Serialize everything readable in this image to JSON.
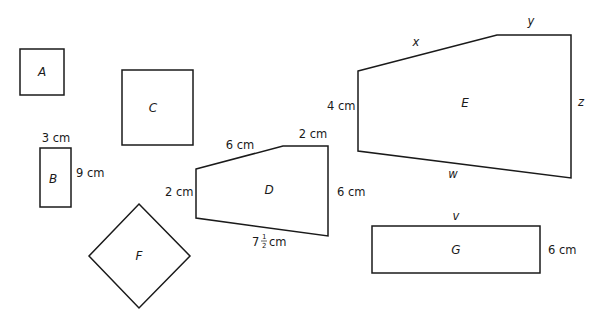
{
  "diagram": {
    "shapes": [
      {
        "id": "A",
        "label": "A",
        "type": "square",
        "dimensions": []
      },
      {
        "id": "B",
        "label": "B",
        "type": "rectangle",
        "dimensions": [
          {
            "side": "top",
            "text": "3 cm"
          },
          {
            "side": "right",
            "text": "9 cm"
          }
        ]
      },
      {
        "id": "C",
        "label": "C",
        "type": "square",
        "dimensions": []
      },
      {
        "id": "D",
        "label": "D",
        "type": "pentagon",
        "dimensions": [
          {
            "side": "left",
            "text": "2 cm"
          },
          {
            "side": "top-slant",
            "text": "6 cm"
          },
          {
            "side": "top",
            "text": "2 cm"
          },
          {
            "side": "right",
            "text": "6 cm"
          },
          {
            "side": "bottom",
            "whole": "7",
            "numerator": "1",
            "denominator": "2",
            "unit": "cm",
            "text": "7½ cm"
          }
        ]
      },
      {
        "id": "E",
        "label": "E",
        "type": "pentagon",
        "dimensions": [
          {
            "side": "left",
            "text": "4 cm"
          },
          {
            "side": "top-slant",
            "text": "x"
          },
          {
            "side": "top",
            "text": "y"
          },
          {
            "side": "right",
            "text": "z"
          },
          {
            "side": "bottom",
            "text": "w"
          }
        ]
      },
      {
        "id": "F",
        "label": "F",
        "type": "square-rotated",
        "dimensions": []
      },
      {
        "id": "G",
        "label": "G",
        "type": "rectangle",
        "dimensions": [
          {
            "side": "top",
            "text": "v"
          },
          {
            "side": "right",
            "text": "6 cm"
          }
        ]
      }
    ]
  },
  "colors": {
    "stroke": "#1a1a1a",
    "background": "#ffffff"
  }
}
